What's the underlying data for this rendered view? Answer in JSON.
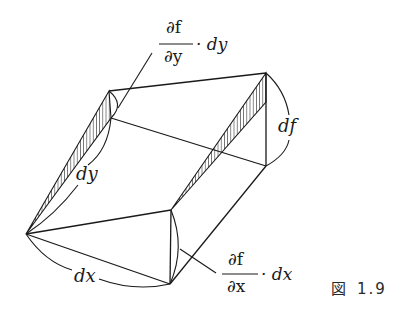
{
  "figure": {
    "caption_prefix": "図",
    "caption_number": "1.9"
  },
  "labels": {
    "dfdy_num": "∂f",
    "dfdy_den": "∂y",
    "dfdy_mult": "· dy",
    "dfdx_num": "∂f",
    "dfdx_den": "∂x",
    "dfdx_mult": "· dx",
    "dy": "dy",
    "dx": "dx",
    "df": "df"
  },
  "colors": {
    "line": "#1a1a1a",
    "background": "#ffffff"
  }
}
